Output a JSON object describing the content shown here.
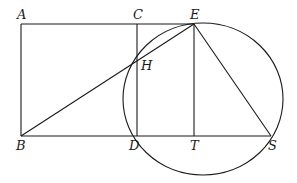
{
  "diagram": {
    "type": "geometry",
    "points": {
      "A": {
        "label": "A",
        "x": 21,
        "y": 24
      },
      "C": {
        "label": "C",
        "x": 137,
        "y": 24
      },
      "E": {
        "label": "E",
        "x": 194,
        "y": 24
      },
      "H": {
        "label": "H",
        "x": 136,
        "y": 62
      },
      "B": {
        "label": "B",
        "x": 21,
        "y": 136
      },
      "D": {
        "label": "D",
        "x": 137,
        "y": 136
      },
      "T": {
        "label": "T",
        "x": 194,
        "y": 136
      },
      "S": {
        "label": "S",
        "x": 271,
        "y": 136
      }
    },
    "segments": [
      "AE",
      "AB",
      "BS",
      "CD",
      "ET",
      "BE",
      "ES"
    ],
    "circle": {
      "through": [
        "E",
        "H",
        "D",
        "S"
      ],
      "cx": 203,
      "cy": 99,
      "rx": 80,
      "ry": 76
    },
    "color": "#1a1a1a"
  }
}
